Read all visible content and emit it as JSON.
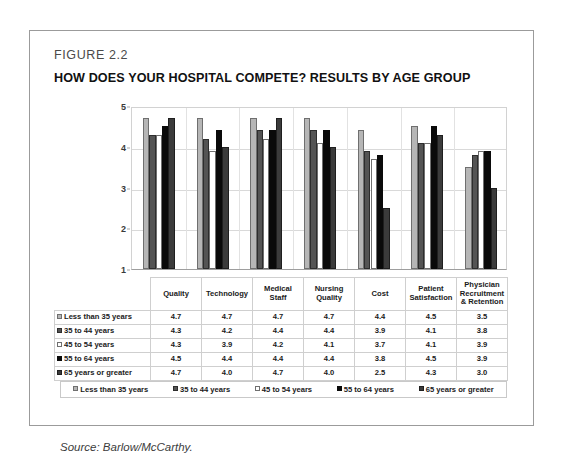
{
  "figure": {
    "number": "FIGURE 2.2",
    "title": "HOW DOES YOUR HOSPITAL COMPETE? RESULTS BY AGE GROUP",
    "source": "Source: Barlow/McCarthy."
  },
  "chart_data": {
    "type": "bar",
    "title": "HOW DOES YOUR HOSPITAL COMPETE? RESULTS BY AGE GROUP",
    "xlabel": "",
    "ylabel": "",
    "ylim": [
      1,
      5
    ],
    "yticks": [
      "1",
      "2",
      "3",
      "4",
      "5"
    ],
    "grid": true,
    "legend_position": "bottom",
    "categories": [
      "Quality",
      "Technology",
      "Medical Staff",
      "Nursing Quality",
      "Cost",
      "Patient Satisfaction",
      "Physician Recruitment & Retention"
    ],
    "series": [
      {
        "name": "Less than 35 years",
        "color": "#b6b6b6",
        "values": [
          4.7,
          4.7,
          4.7,
          4.7,
          4.4,
          4.5,
          3.5
        ]
      },
      {
        "name": "35 to 44 years",
        "color": "#545454",
        "values": [
          4.3,
          4.2,
          4.4,
          4.4,
          3.9,
          4.1,
          3.8
        ]
      },
      {
        "name": "45 to 54 years",
        "color": "#ffffff",
        "values": [
          4.3,
          3.9,
          4.2,
          4.1,
          3.7,
          4.1,
          3.9
        ]
      },
      {
        "name": "55 to 64 years",
        "color": "#0a0a0a",
        "values": [
          4.5,
          4.4,
          4.4,
          4.4,
          3.8,
          4.5,
          3.9
        ]
      },
      {
        "name": "65 years or greater",
        "color": "#3b3b3b",
        "values": [
          4.7,
          4.0,
          4.7,
          4.0,
          2.5,
          4.3,
          3.0
        ]
      }
    ]
  },
  "table": {
    "columns": [
      "Quality",
      "Technology",
      "Medical Staff",
      "Nursing Quality",
      "Cost",
      "Patient Satisfaction",
      "Physician Recruitment & Retention"
    ],
    "rows": [
      {
        "label": "Less than 35 years",
        "values": [
          "4.7",
          "4.7",
          "4.7",
          "4.7",
          "4.4",
          "4.5",
          "3.5"
        ]
      },
      {
        "label": "35 to 44 years",
        "values": [
          "4.3",
          "4.2",
          "4.4",
          "4.4",
          "3.9",
          "4.1",
          "3.8"
        ]
      },
      {
        "label": "45 to 54 years",
        "values": [
          "4.3",
          "3.9",
          "4.2",
          "4.1",
          "3.7",
          "4.1",
          "3.9"
        ]
      },
      {
        "label": "55 to 64 years",
        "values": [
          "4.5",
          "4.4",
          "4.4",
          "4.4",
          "3.8",
          "4.5",
          "3.9"
        ]
      },
      {
        "label": "65 years or greater",
        "values": [
          "4.7",
          "4.0",
          "4.7",
          "4.0",
          "2.5",
          "4.3",
          "3.0"
        ]
      }
    ]
  },
  "legend": {
    "items": [
      "Less than 35 years",
      "35 to 44 years",
      "45 to 54 years",
      "55 to 64 years",
      "65 years or greater"
    ]
  }
}
